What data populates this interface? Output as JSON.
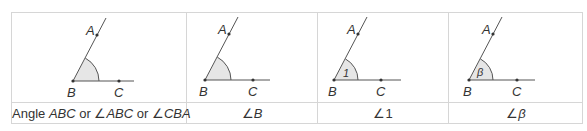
{
  "table": {
    "columns": [
      {
        "diagram": {
          "points": [
            "A",
            "B",
            "C"
          ],
          "angle_marker": ""
        },
        "caption_parts": [
          "Angle ",
          "ABC",
          " or ∠",
          "ABC",
          " or ∠",
          "CBA"
        ]
      },
      {
        "diagram": {
          "points": [
            "A",
            "B",
            "C"
          ],
          "angle_marker": ""
        },
        "caption_parts": [
          "∠",
          "B"
        ]
      },
      {
        "diagram": {
          "points": [
            "A",
            "B",
            "C"
          ],
          "angle_marker": "1"
        },
        "caption_parts": [
          "∠",
          "1"
        ]
      },
      {
        "diagram": {
          "points": [
            "A",
            "B",
            "C"
          ],
          "angle_marker": "β"
        },
        "caption_parts": [
          "∠",
          "β"
        ]
      }
    ]
  },
  "colors": {
    "border": "#d6d6d6",
    "line": "#555555",
    "arc_fill": "#e6e6e6",
    "text": "#333333"
  }
}
